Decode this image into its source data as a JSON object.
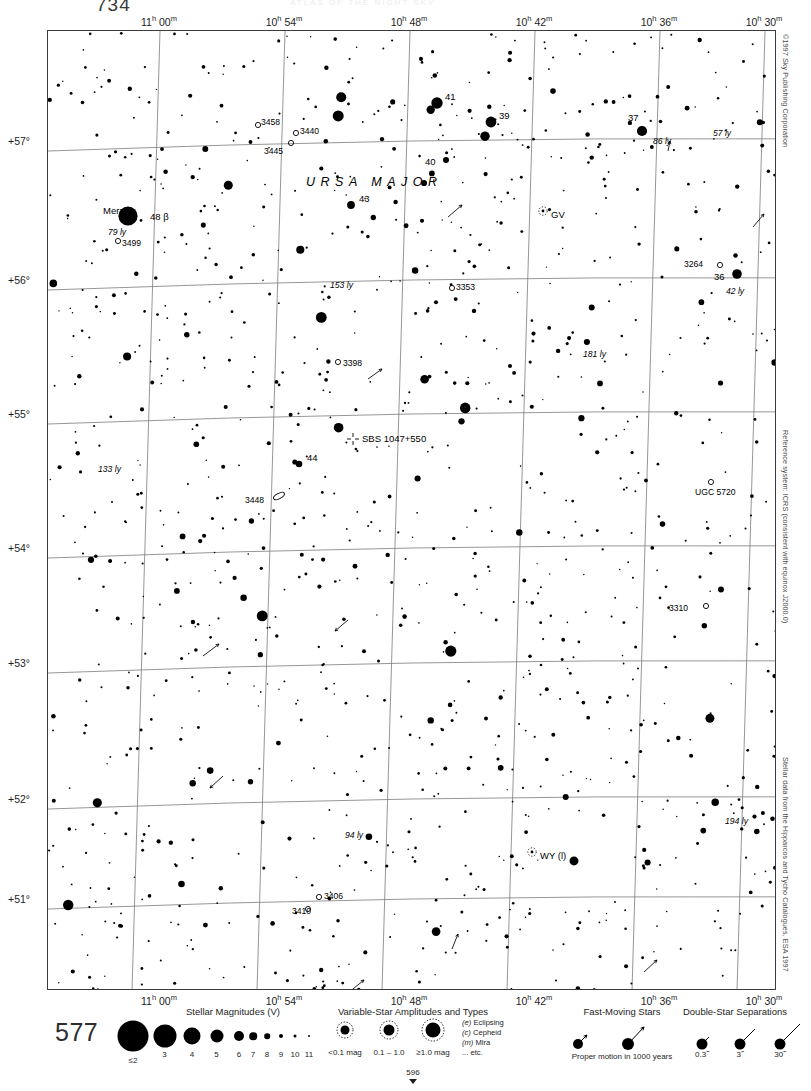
{
  "page": {
    "number_top": "734",
    "number_big": "577",
    "next_page": "596",
    "header_faint": "ATLAS OF THE NIGHT SKY"
  },
  "side_notes": {
    "copyright": "©1997 Sky Publishing Corporation",
    "reference": "Reference system: ICRS (consistent with equinox J2000.0)",
    "catalogue": "Stellar data from the Hipparcos and Tycho Catalogues, ESA 1997"
  },
  "chart_data": {
    "type": "scatter",
    "xlabel": "Right Ascension",
    "ylabel": "Declination",
    "grid": true,
    "xlim": [
      "11h02m",
      "10h28m"
    ],
    "ylim": [
      50.6,
      57.4
    ],
    "ra_ticks": [
      {
        "label_h": "11",
        "label_m": "00",
        "x": 112
      },
      {
        "label_h": "10",
        "label_m": "54",
        "x": 237
      },
      {
        "label_h": "10",
        "label_m": "48",
        "x": 362
      },
      {
        "label_h": "10",
        "label_m": "42",
        "x": 487
      },
      {
        "label_h": "10",
        "label_m": "36",
        "x": 612
      },
      {
        "label_h": "10",
        "label_m": "30",
        "x": 717
      }
    ],
    "dec_ticks": [
      {
        "label": "+57°",
        "y": 111
      },
      {
        "label": "+56°",
        "y": 250
      },
      {
        "label": "+55°",
        "y": 384
      },
      {
        "label": "+54°",
        "y": 518
      },
      {
        "label": "+53°",
        "y": 633
      },
      {
        "label": "+52°",
        "y": 769
      },
      {
        "label": "+51°",
        "y": 869
      }
    ],
    "constellation_labels": [
      {
        "text": "URSA MAJOR",
        "x": 258,
        "y": 144
      },
      {
        "text": "URSA MAJOR",
        "x": 490,
        "y": 968
      }
    ],
    "named_stars": [
      {
        "name": "Merak",
        "x": 80,
        "y": 185,
        "label_x": 55,
        "label_y": 182,
        "mag": 2.3,
        "distance_ly": "79 ly",
        "bayer": "48 β"
      },
      {
        "name": "41",
        "x": 389,
        "y": 72,
        "mag": 3.6
      },
      {
        "name": "39",
        "x": 443,
        "y": 91,
        "mag": 3.7
      },
      {
        "name": "37",
        "x": 594,
        "y": 100,
        "mag": 3.8,
        "distance_ly": "86 ly"
      },
      {
        "name": "40",
        "x": 398,
        "y": 129,
        "mag": 4.5
      },
      {
        "name": "43",
        "x": 303,
        "y": 174,
        "mag": 4.2
      },
      {
        "name": "36",
        "x": 689,
        "y": 243,
        "mag": 3.9,
        "distance_ly": "42 ly"
      },
      {
        "name": "44",
        "x": 251,
        "y": 433,
        "mag": 4.4
      }
    ],
    "distance_annotations": [
      {
        "text": "79 ly",
        "x": 60,
        "y": 196
      },
      {
        "text": "86 ly",
        "x": 605,
        "y": 105
      },
      {
        "text": "57 ly",
        "x": 665,
        "y": 97
      },
      {
        "text": "153 ly",
        "x": 282,
        "y": 249
      },
      {
        "text": "42 ly",
        "x": 678,
        "y": 255
      },
      {
        "text": "181 ly",
        "x": 535,
        "y": 318
      },
      {
        "text": "133 ly",
        "x": 50,
        "y": 433
      },
      {
        "text": "94 ly",
        "x": 297,
        "y": 799
      },
      {
        "text": "194 ly",
        "x": 677,
        "y": 785
      }
    ],
    "deep_sky_objects": [
      {
        "id": "3458",
        "type": "open-cluster",
        "x": 210,
        "y": 94,
        "label_x": 213,
        "label_y": 92
      },
      {
        "id": "3440",
        "type": "open-cluster",
        "x": 248,
        "y": 102,
        "label_x": 252,
        "label_y": 101
      },
      {
        "id": "3445",
        "type": "open-cluster",
        "x": 243,
        "y": 112,
        "label_x": 216,
        "label_y": 121
      },
      {
        "id": "3499",
        "type": "open-cluster",
        "x": 70,
        "y": 210,
        "label_x": 74,
        "label_y": 213
      },
      {
        "id": "3264",
        "type": "open-cluster",
        "x": 672,
        "y": 234,
        "label_x": 636,
        "label_y": 234
      },
      {
        "id": "3353",
        "type": "open-cluster",
        "x": 404,
        "y": 257,
        "label_x": 408,
        "label_y": 257
      },
      {
        "id": "3398",
        "type": "open-cluster",
        "x": 290,
        "y": 331,
        "label_x": 295,
        "label_y": 333
      },
      {
        "id": "3448",
        "type": "galaxy",
        "x": 231,
        "y": 465,
        "label_x": 197,
        "label_y": 470
      },
      {
        "id": "UGC 5720",
        "type": "galaxy",
        "x": 663,
        "y": 451,
        "label_x": 647,
        "label_y": 462
      },
      {
        "id": "3310",
        "type": "galaxy",
        "x": 658,
        "y": 575,
        "label_x": 621,
        "label_y": 578
      },
      {
        "id": "3406",
        "type": "open-cluster",
        "x": 271,
        "y": 866,
        "label_x": 276,
        "label_y": 866
      },
      {
        "id": "3410",
        "type": "open-cluster",
        "x": 260,
        "y": 878,
        "label_x": 244,
        "label_y": 881
      }
    ],
    "quasars": [
      {
        "id": "SBS 1047+550",
        "x": 305,
        "y": 408,
        "label_x": 314,
        "label_y": 408
      }
    ],
    "variable_stars": [
      {
        "id": "GV",
        "x": 495,
        "y": 180,
        "label_x": 503,
        "label_y": 184
      },
      {
        "id": "WY (l)",
        "x": 484,
        "y": 821,
        "label_x": 492,
        "label_y": 825
      }
    ]
  },
  "legend": {
    "magnitudes": {
      "title": "Stellar Magnitudes (V)",
      "entries": [
        {
          "label": "≤2",
          "radius": 15.5
        },
        {
          "label": "3",
          "radius": 11.5
        },
        {
          "label": "4",
          "radius": 8.5
        },
        {
          "label": "5",
          "radius": 6.5
        },
        {
          "label": "6",
          "radius": 5.0
        },
        {
          "label": "7",
          "radius": 3.8
        },
        {
          "label": "8",
          "radius": 2.8
        },
        {
          "label": "9",
          "radius": 2.0
        },
        {
          "label": "10",
          "radius": 1.5
        },
        {
          "label": "11",
          "radius": 1.0
        }
      ]
    },
    "variables": {
      "title": "Variable-Star Amplitudes and Types",
      "amplitudes": [
        {
          "label": "<0.1 mag"
        },
        {
          "label": "0.1 – 1.0"
        },
        {
          "label": "≥1.0 mag"
        }
      ],
      "types": [
        {
          "code": "(e)",
          "name": "Eclipsing"
        },
        {
          "code": "(c)",
          "name": "Cepheid"
        },
        {
          "code": "(m)",
          "name": "Mira"
        },
        {
          "code": "",
          "name": "... etc."
        }
      ]
    },
    "fast_moving": {
      "title": "Fast-Moving Stars",
      "caption": "Proper motion in 1000 years"
    },
    "doubles": {
      "title": "Double-Star Separations",
      "entries": [
        {
          "label": "0.3˝"
        },
        {
          "label": "3˝"
        },
        {
          "label": "30˝"
        }
      ]
    }
  }
}
